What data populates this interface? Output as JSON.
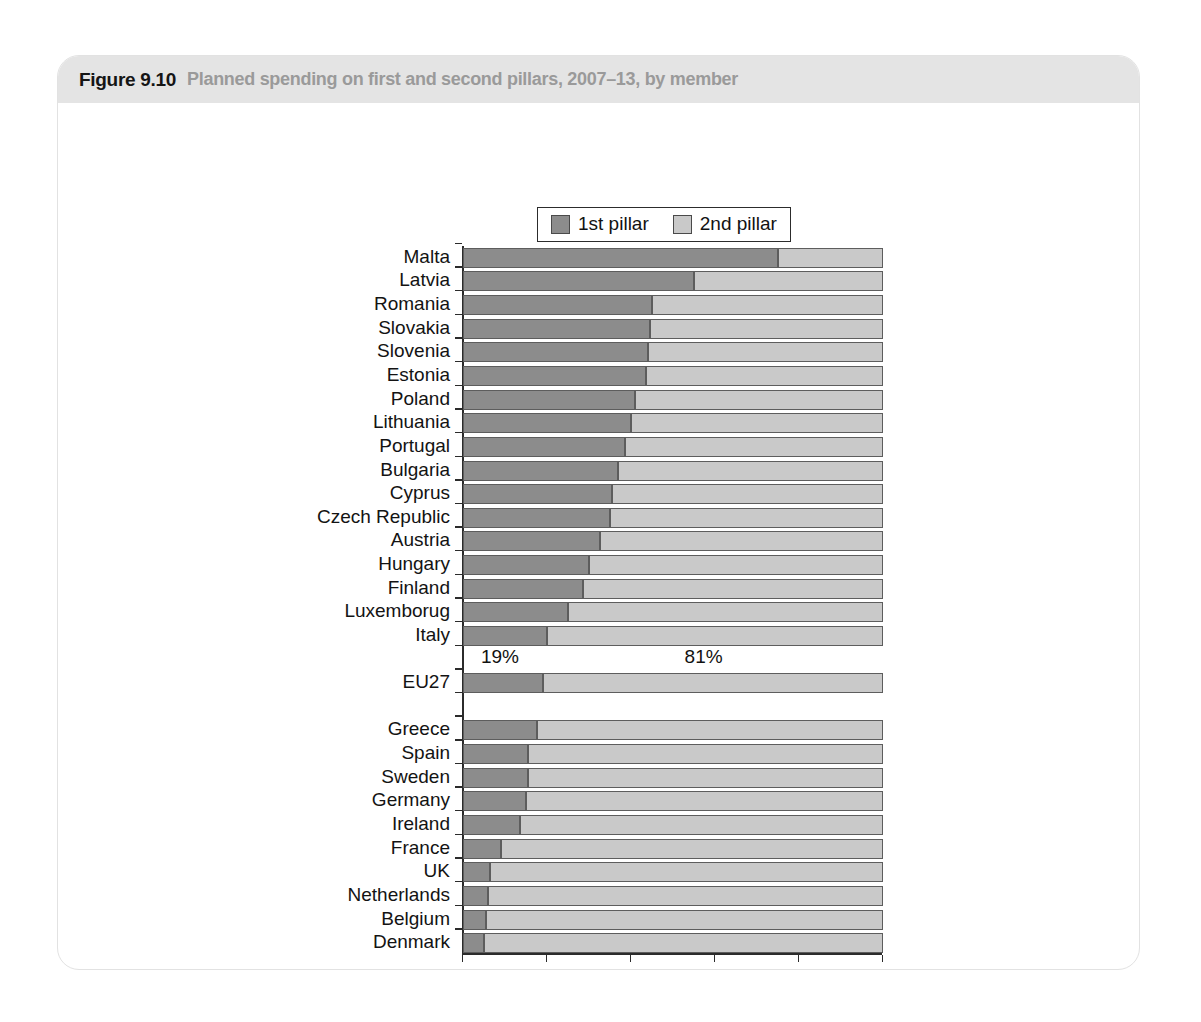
{
  "figure": {
    "number": "Figure 9.10",
    "caption": "Planned spending on first and second pillars, 2007–13, by member"
  },
  "legend": {
    "entries": [
      {
        "label": "1st pillar",
        "color": "#8c8c8c"
      },
      {
        "label": "2nd pillar",
        "color": "#c9c9c9"
      }
    ]
  },
  "annotations": [
    {
      "text": "19%",
      "x_pct": 4.5
    },
    {
      "text": "81%",
      "x_pct": 53.0
    }
  ],
  "chart_data": {
    "type": "bar",
    "orientation": "horizontal",
    "stacked": true,
    "normalized": true,
    "title": "Planned spending on first and second pillars, 2007–13, by member",
    "xlabel": "(%)",
    "ylabel": "",
    "xlim": [
      0,
      100
    ],
    "xticks": [
      0,
      20,
      40,
      60,
      80,
      100
    ],
    "xticklabels": [
      "0",
      "20",
      "40",
      "60",
      "80",
      "100"
    ],
    "grid": false,
    "legend_position": "top-center",
    "categories": [
      "Malta",
      "Latvia",
      "Romania",
      "Slovakia",
      "Slovenia",
      "Estonia",
      "Poland",
      "Lithuania",
      "Portugal",
      "Bulgaria",
      "Cyprus",
      "Czech Republic",
      "Austria",
      "Hungary",
      "Finland",
      "Luxemborug",
      "Italy",
      "",
      "EU27",
      "",
      "Greece",
      "Spain",
      "Sweden",
      "Germany",
      "Ireland",
      "France",
      "UK",
      "Netherlands",
      "Belgium",
      "Denmark"
    ],
    "series": [
      {
        "name": "1st pillar",
        "color": "#8c8c8c",
        "values": [
          75,
          55,
          45,
          44.5,
          44,
          43.5,
          41,
          40,
          38.5,
          37,
          35.5,
          35,
          32.5,
          30,
          28.5,
          25,
          20,
          null,
          19,
          null,
          17.5,
          15.5,
          15.5,
          15,
          13.5,
          9,
          6.5,
          6,
          5.5,
          5
        ]
      },
      {
        "name": "2nd pillar",
        "color": "#c9c9c9",
        "values": [
          25,
          45,
          55,
          55.5,
          56,
          56.5,
          59,
          60,
          61.5,
          63,
          64.5,
          65,
          67.5,
          70,
          71.5,
          75,
          80,
          null,
          81,
          null,
          82.5,
          84.5,
          84.5,
          85,
          86.5,
          91,
          93.5,
          94,
          94.5,
          95
        ]
      }
    ]
  }
}
